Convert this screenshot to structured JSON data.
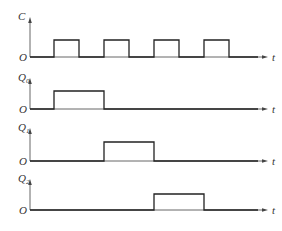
{
  "diagram": {
    "type": "timing-diagram",
    "time_axis_label": "t",
    "origin_label": "O",
    "pulse_period_px": 50,
    "signals": [
      {
        "name": "C",
        "subscript": "",
        "axis_top": 18,
        "high_y": 40,
        "base_y": 57,
        "pulses": [
          [
            54,
            79
          ],
          [
            104,
            129
          ],
          [
            154,
            179
          ],
          [
            204,
            229
          ]
        ]
      },
      {
        "name": "Q",
        "subscript": "0",
        "axis_top": 79,
        "high_y": 91,
        "base_y": 109,
        "pulses": [
          [
            54,
            104
          ]
        ]
      },
      {
        "name": "Q",
        "subscript": "1",
        "axis_top": 129,
        "high_y": 142,
        "base_y": 161,
        "pulses": [
          [
            104,
            154
          ]
        ]
      },
      {
        "name": "Q",
        "subscript": "2",
        "axis_top": 180,
        "high_y": 194,
        "base_y": 210,
        "pulses": [
          [
            154,
            204
          ]
        ]
      }
    ],
    "x_axis_start": 30,
    "x_axis_end": 268
  }
}
